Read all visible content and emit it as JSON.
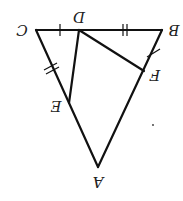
{
  "diagram": {
    "orientation": "rotated 180 degrees",
    "points": {
      "A": {
        "label": "A",
        "x": 98,
        "y": 167
      },
      "B": {
        "label": "B",
        "x": 162,
        "y": 30
      },
      "C": {
        "label": "C",
        "x": 36,
        "y": 30
      },
      "D": {
        "label": "D",
        "x": 79,
        "y": 30
      },
      "E": {
        "label": "E",
        "x": 69,
        "y": 103
      },
      "F": {
        "label": "F",
        "x": 144,
        "y": 71
      }
    },
    "segments": [
      {
        "from": "A",
        "to": "B"
      },
      {
        "from": "B",
        "to": "C"
      },
      {
        "from": "C",
        "to": "A"
      },
      {
        "from": "D",
        "to": "E"
      },
      {
        "from": "D",
        "to": "F"
      }
    ],
    "tick_marks": [
      {
        "segment": "CD",
        "count": 1
      },
      {
        "segment": "BF",
        "count": 1
      },
      {
        "segment": "DB",
        "count": 2
      },
      {
        "segment": "CE",
        "count": 2
      }
    ],
    "labels": {
      "A": "A",
      "B": "B",
      "C": "C",
      "D": "D",
      "E": "E",
      "F": "F"
    },
    "stroke_color": "#111111",
    "background": "#ffffff"
  }
}
